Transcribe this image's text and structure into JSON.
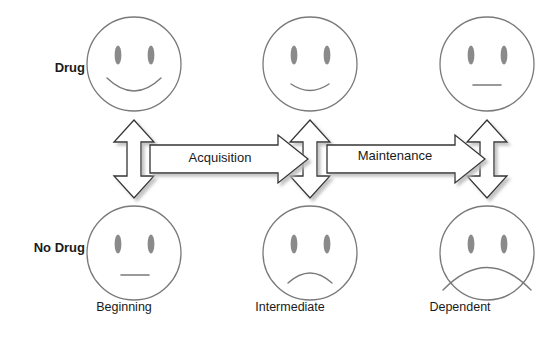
{
  "diagram": {
    "background_color": "#ffffff",
    "stroke_color": "#7a7a7a",
    "arrow_stroke_color": "#333333",
    "eye_color": "#8a8a8a",
    "text_color": "#1a1a1a",
    "shadow_color": "#cccccc"
  },
  "row_labels": [
    {
      "key": "drug",
      "label": "Drug"
    },
    {
      "key": "no_drug",
      "label": "No Drug"
    }
  ],
  "column_labels": [
    {
      "key": "beginning",
      "label": "Beginning"
    },
    {
      "key": "intermediate",
      "label": "Intermediate"
    },
    {
      "key": "dependent",
      "label": "Dependent"
    }
  ],
  "faces": [
    {
      "row": "drug",
      "column": "beginning",
      "expression": "big-smile",
      "icon": "smiley-face-icon"
    },
    {
      "row": "drug",
      "column": "intermediate",
      "expression": "small-smile",
      "icon": "smiley-face-icon"
    },
    {
      "row": "drug",
      "column": "dependent",
      "expression": "neutral",
      "icon": "neutral-face-icon"
    },
    {
      "row": "no_drug",
      "column": "beginning",
      "expression": "neutral",
      "icon": "neutral-face-icon"
    },
    {
      "row": "no_drug",
      "column": "intermediate",
      "expression": "frown",
      "icon": "frowning-face-icon"
    },
    {
      "row": "no_drug",
      "column": "dependent",
      "expression": "deep-frown",
      "icon": "deep-frowning-face-icon"
    }
  ],
  "horizontal_arrows": [
    {
      "key": "acquisition",
      "label": "Acquisition",
      "from": "beginning",
      "to": "intermediate",
      "direction": "right"
    },
    {
      "key": "maintenance",
      "label": "Maintenance",
      "from": "intermediate",
      "to": "dependent",
      "direction": "right"
    }
  ],
  "vertical_arrows": [
    {
      "key": "beginning",
      "column": "beginning",
      "direction": "both",
      "label": ""
    },
    {
      "key": "intermediate",
      "column": "intermediate",
      "direction": "both",
      "label": ""
    },
    {
      "key": "dependent",
      "column": "dependent",
      "direction": "both",
      "label": ""
    }
  ]
}
